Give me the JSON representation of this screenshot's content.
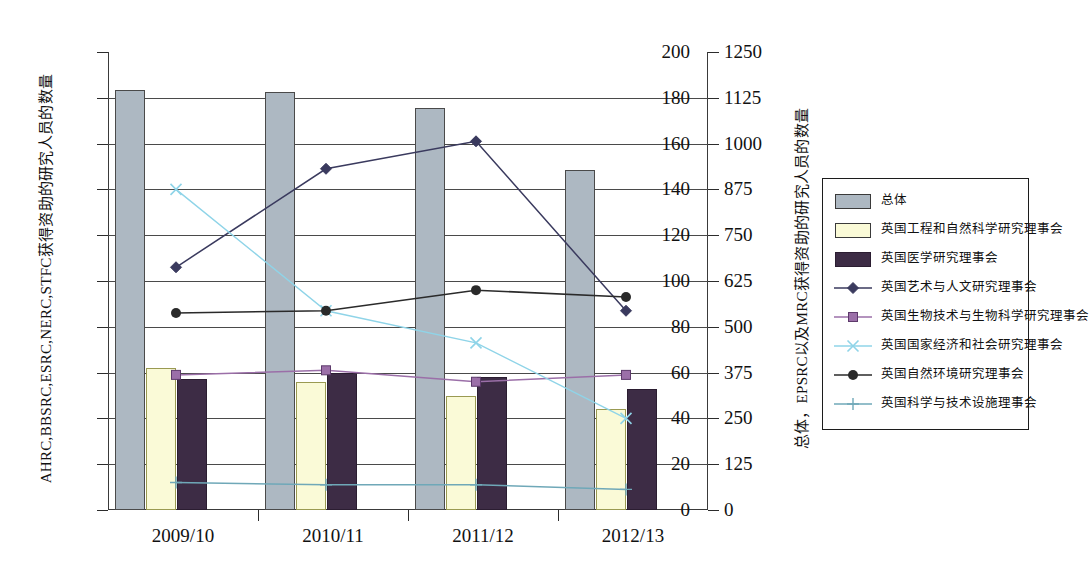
{
  "axes": {
    "ylabel_left": "AHRC,BBSRC,ESRC,NERC,STFC获得资助的研究人员的数量",
    "ylabel_right": "总体，EPSRC以及MRC获得资助的研究人员的数量"
  },
  "legend": {
    "items": [
      {
        "label": "总体",
        "marker": "swatch-total",
        "color": "#adb8c2"
      },
      {
        "label": "英国工程和自然科学研究理事会",
        "marker": "swatch-epsrc",
        "color": "#fafad7"
      },
      {
        "label": "英国医学研究理事会",
        "marker": "swatch-mrc",
        "color": "#3d2c45"
      },
      {
        "label": "英国艺术与人文研究理事会",
        "marker": "diamond",
        "color": "#3a3a5e"
      },
      {
        "label": "英国生物技术与生物科学研究理事会",
        "marker": "square",
        "color": "#9b6fa8"
      },
      {
        "label": "英国国家经济和社会研究理事会",
        "marker": "cross",
        "color": "#8fd4e8"
      },
      {
        "label": "英国自然环境研究理事会",
        "marker": "circle",
        "color": "#2a2a2a"
      },
      {
        "label": "英国科学与技术设施理事会",
        "marker": "plus",
        "color": "#6fa8b8"
      }
    ]
  },
  "chart_data": {
    "type": "bar",
    "title": "",
    "xlabel": "",
    "ylabel": "AHRC,BBSRC,ESRC,NERC,STFC获得资助的研究人员的数量",
    "ylabel_secondary": "总体，EPSRC以及MRC获得资助的研究人员的数量",
    "categories": [
      "2009/10",
      "2010/11",
      "2011/12",
      "2012/13"
    ],
    "ylim": [
      0,
      200
    ],
    "yticks": [
      0,
      20,
      40,
      60,
      80,
      100,
      120,
      140,
      160,
      180,
      200
    ],
    "ylim_secondary": [
      0,
      1250
    ],
    "yticks_secondary": [
      0,
      125,
      250,
      375,
      500,
      625,
      750,
      875,
      1000,
      1125,
      1250
    ],
    "grid": true,
    "legend_position": "right",
    "bar_series": [
      {
        "name": "总体",
        "axis": "secondary",
        "color": "#adb8c2",
        "values": [
          1147,
          1141,
          1097,
          928
        ]
      },
      {
        "name": "英国工程和自然科学研究理事会",
        "axis": "secondary",
        "color": "#fafad7",
        "values": [
          388,
          350,
          313,
          275
        ]
      },
      {
        "name": "英国医学研究理事会",
        "axis": "secondary",
        "color": "#3d2c45",
        "values": [
          356,
          375,
          363,
          331
        ]
      }
    ],
    "line_series": [
      {
        "name": "英国艺术与人文研究理事会",
        "axis": "primary",
        "color": "#3a3a5e",
        "marker": "diamond",
        "values": [
          106,
          149,
          161,
          87
        ]
      },
      {
        "name": "英国生物技术与生物科学研究理事会",
        "axis": "primary",
        "color": "#9b6fa8",
        "marker": "square",
        "values": [
          59,
          61,
          56,
          59
        ]
      },
      {
        "name": "英国国家经济和社会研究理事会",
        "axis": "primary",
        "color": "#8fd4e8",
        "marker": "cross",
        "values": [
          140,
          87,
          73,
          40
        ]
      },
      {
        "name": "英国自然环境研究理事会",
        "axis": "primary",
        "color": "#2a2a2a",
        "marker": "circle",
        "values": [
          86,
          87,
          96,
          93
        ]
      },
      {
        "name": "英国科学与技术设施理事会",
        "axis": "primary",
        "color": "#6fa8b8",
        "marker": "plus",
        "values": [
          12,
          11,
          11,
          9
        ]
      }
    ],
    "bar_values_primary_scale": {
      "总体": [
        183.5,
        182.5,
        175.5,
        148.5
      ],
      "英国工程和自然科学研究理事会": [
        62,
        56,
        50,
        44
      ],
      "英国医学研究理事会": [
        57,
        60,
        58,
        53
      ]
    }
  }
}
